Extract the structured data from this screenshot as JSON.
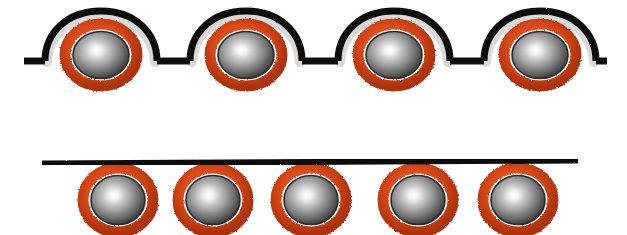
{
  "figure": {
    "title": "Particles coated by a flexible membrane line",
    "width": 627,
    "height": 235,
    "background_color": "#ffffff"
  },
  "colors": {
    "membrane_black": "#111111",
    "shell_light_gray": "#d9d9d9",
    "ring_orange": "#de4a18",
    "ring_orange_dark": "#a8300c",
    "sphere_highlight": "#ffffff",
    "sphere_mid": "#9a9a9a",
    "sphere_edge": "#3a3a3a",
    "sphere_outline": "#2b2b2b"
  },
  "panels": [
    {
      "id": "top-panel",
      "name": "wrapped-particles-row",
      "description": "Black membrane line bulging upward over four coated particles",
      "line": {
        "name": "membrane-line-top",
        "y_baseline": 61,
        "x_start": 24,
        "x_end": 607,
        "stroke_width": 7,
        "color": "#111111",
        "style": "arched-over-particles"
      },
      "shell": {
        "visible": true,
        "color": "#d9d9d9",
        "stroke_width": 9
      },
      "particles": [
        {
          "name": "particle-top-1",
          "cx": 101,
          "cy": 55,
          "rx": 36,
          "ry": 30,
          "ring_color": "#de4a18",
          "core_color": "#8d8d8d"
        },
        {
          "name": "particle-top-2",
          "cx": 246,
          "cy": 55,
          "rx": 36,
          "ry": 30,
          "ring_color": "#de4a18",
          "core_color": "#8d8d8d"
        },
        {
          "name": "particle-top-3",
          "cx": 394,
          "cy": 55,
          "rx": 36,
          "ry": 30,
          "ring_color": "#de4a18",
          "core_color": "#8d8d8d"
        },
        {
          "name": "particle-top-4",
          "cx": 540,
          "cy": 55,
          "rx": 36,
          "ry": 30,
          "ring_color": "#de4a18",
          "core_color": "#8d8d8d"
        }
      ],
      "bumps": [
        {
          "cx": 101,
          "half_width": 56,
          "height": 40
        },
        {
          "cx": 246,
          "half_width": 56,
          "height": 40
        },
        {
          "cx": 394,
          "half_width": 56,
          "height": 40
        },
        {
          "cx": 540,
          "half_width": 56,
          "height": 40
        }
      ]
    },
    {
      "id": "bottom-panel",
      "name": "attached-particles-row",
      "description": "Straight black line with five coated particles hanging beneath",
      "line": {
        "name": "membrane-line-bottom",
        "y_baseline": 162,
        "x_start": 42,
        "x_end": 578,
        "stroke_width": 5,
        "color": "#111111",
        "style": "straight"
      },
      "shell": {
        "visible": false
      },
      "particles": [
        {
          "name": "particle-bottom-1",
          "cx": 118,
          "cy": 200,
          "rx": 36,
          "ry": 32,
          "ring_color": "#de4a18",
          "core_color": "#8d8d8d"
        },
        {
          "name": "particle-bottom-2",
          "cx": 213,
          "cy": 200,
          "rx": 36,
          "ry": 32,
          "ring_color": "#de4a18",
          "core_color": "#8d8d8d"
        },
        {
          "name": "particle-bottom-3",
          "cx": 311,
          "cy": 200,
          "rx": 36,
          "ry": 32,
          "ring_color": "#de4a18",
          "core_color": "#8d8d8d"
        },
        {
          "name": "particle-bottom-4",
          "cx": 418,
          "cy": 200,
          "rx": 36,
          "ry": 32,
          "ring_color": "#de4a18",
          "core_color": "#8d8d8d"
        },
        {
          "name": "particle-bottom-5",
          "cx": 518,
          "cy": 200,
          "rx": 36,
          "ry": 32,
          "ring_color": "#de4a18",
          "core_color": "#8d8d8d"
        }
      ]
    }
  ],
  "counts": {
    "top_particles": 4,
    "bottom_particles": 5,
    "total_particles": 9
  }
}
